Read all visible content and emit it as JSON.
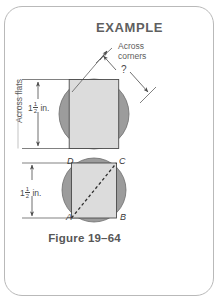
{
  "figure": {
    "title": "EXAMPLE",
    "caption": "Figure 19–64",
    "labels": {
      "across_corners": "Across\ncorners",
      "across_corners_line1": "Across",
      "across_corners_line2": "corners",
      "across_flats": "Across flats",
      "unknown": "?",
      "dimension_top_whole": "1",
      "dimension_top_num": "1",
      "dimension_top_den": "2",
      "dimension_top_unit": "in.",
      "dimension_bottom_whole": "1",
      "dimension_bottom_num": "1",
      "dimension_bottom_den": "2",
      "dimension_bottom_unit": "in."
    },
    "vertex_labels": {
      "top_left": "D",
      "top_right": "C",
      "bottom_left": "A",
      "bottom_right": "B"
    },
    "colors": {
      "circle_fill": "#9c9c9c",
      "square_fill": "#dcdcdc",
      "outline": "#4a4a4a",
      "box_border": "#b9b9b9",
      "text": "#5d5d5d",
      "caption_text": "#575757",
      "background": "#ffffff"
    },
    "geometry": {
      "upper_circle_cx": 94,
      "upper_circle_cy": 114,
      "upper_circle_r": 35,
      "upper_square_side": 49.5,
      "lower_circle_cx": 94,
      "lower_circle_cy": 190,
      "lower_circle_r": 32,
      "lower_square_side": 45
    },
    "dimension_values": {
      "across_flats_in": 1.5,
      "across_corners_in": null
    }
  }
}
